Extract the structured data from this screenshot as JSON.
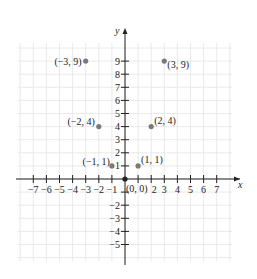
{
  "chart_data": {
    "type": "scatter",
    "title": "",
    "xlabel": "x",
    "ylabel": "y",
    "xlim": [
      -8,
      8
    ],
    "ylim": [
      -6,
      10
    ],
    "grid": true,
    "x_ticks": [
      -7,
      -6,
      -5,
      -4,
      -3,
      -2,
      -1,
      2,
      3,
      4,
      5,
      6,
      7
    ],
    "y_ticks": [
      9,
      8,
      7,
      6,
      5,
      4,
      3,
      2,
      1,
      -2,
      -3,
      -4,
      -5
    ],
    "points": [
      {
        "x": -3,
        "y": 9,
        "label": "(−3, 9)"
      },
      {
        "x": 3,
        "y": 9,
        "label": "(3, 9)"
      },
      {
        "x": -2,
        "y": 4,
        "label": "(−2, 4)"
      },
      {
        "x": 2,
        "y": 4,
        "label": "(2, 4)"
      },
      {
        "x": -1,
        "y": 1,
        "label": "(−1, 1)"
      },
      {
        "x": 1,
        "y": 1,
        "label": "(1, 1)"
      },
      {
        "x": 0,
        "y": 0,
        "label": "(0, 0)"
      }
    ],
    "colors": {
      "grid": "#e4e4e4",
      "axis": "#222222",
      "point": "#7a7a7a"
    }
  }
}
